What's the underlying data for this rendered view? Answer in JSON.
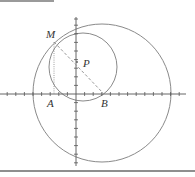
{
  "diagram": {
    "title": "",
    "points": {
      "M": {
        "label": "M",
        "x": 54,
        "y": 42
      },
      "P": {
        "label": "P",
        "x": 77,
        "y": 62
      },
      "A": {
        "label": "A",
        "x": 54,
        "y": 94
      },
      "B": {
        "label": "B",
        "x": 104,
        "y": 94
      }
    },
    "axes": {
      "origin_x": 76,
      "origin_y": 94,
      "x_min": 0,
      "x_max": 186,
      "y_min": 17,
      "y_max": 166,
      "tick_spacing": 8.6
    },
    "circles": [
      {
        "name": "small-circle",
        "cx": 83,
        "cy": 67,
        "r": 34
      },
      {
        "name": "large-circle",
        "cx": 102,
        "cy": 93,
        "r": 69
      }
    ],
    "segments": [
      {
        "name": "MB",
        "style": "dashed"
      },
      {
        "name": "MA",
        "style": "dotted"
      }
    ],
    "colors": {
      "stroke": "#8a8a8a",
      "axis": "#555555",
      "label": "#333333"
    }
  }
}
